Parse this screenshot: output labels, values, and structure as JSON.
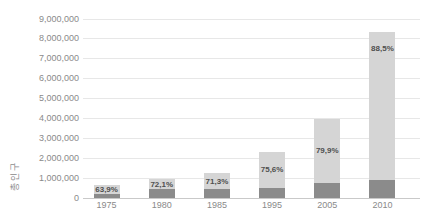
{
  "chart_data": {
    "type": "bar",
    "subtype": "stacked",
    "title": "",
    "xlabel": "",
    "ylabel": "총인구",
    "ylim": [
      0,
      9000000
    ],
    "ytick_step": 1000000,
    "grid": true,
    "legend": "none",
    "yticks": [
      {
        "value": 0,
        "label": "0"
      },
      {
        "value": 1000000,
        "label": "1,000,000"
      },
      {
        "value": 2000000,
        "label": "2,000,000"
      },
      {
        "value": 3000000,
        "label": "3,000,000"
      },
      {
        "value": 4000000,
        "label": "4,000,000"
      },
      {
        "value": 5000000,
        "label": "5,000,000"
      },
      {
        "value": 6000000,
        "label": "6,000,000"
      },
      {
        "value": 7000000,
        "label": "7,000,000"
      },
      {
        "value": 8000000,
        "label": "8,000,000"
      },
      {
        "value": 9000000,
        "label": "9,000,000"
      }
    ],
    "categories": [
      "1975",
      "1980",
      "1985",
      "1995",
      "2005",
      "2010"
    ],
    "bars": [
      {
        "year": "1975",
        "total": 630000,
        "lower_segment": 200000,
        "percent_label": "63,9%",
        "label_position": "center"
      },
      {
        "year": "1980",
        "total": 950000,
        "lower_segment": 450000,
        "percent_label": "72,1%",
        "label_position": "center"
      },
      {
        "year": "1985",
        "total": 1250000,
        "lower_segment": 450000,
        "percent_label": "71,3%",
        "label_position": "center"
      },
      {
        "year": "1995",
        "total": 2330000,
        "lower_segment": 510000,
        "percent_label": "75,6%",
        "label_position": "center"
      },
      {
        "year": "2005",
        "total": 3990000,
        "lower_segment": 760000,
        "percent_label": "79,9%",
        "label_position": "center"
      },
      {
        "year": "2010",
        "total": 8340000,
        "lower_segment": 910000,
        "percent_label": "88,5%",
        "label_position": "top"
      }
    ],
    "colors": {
      "lower_segment": "#8b8b8b",
      "upper_segment": "#d5d5d5",
      "gridline": "#e7e7e7",
      "baseline": "#c9c9c9",
      "tick_label": "#8a8a8a",
      "percent_label": "#4f4f4f",
      "background": "#ffffff"
    }
  }
}
